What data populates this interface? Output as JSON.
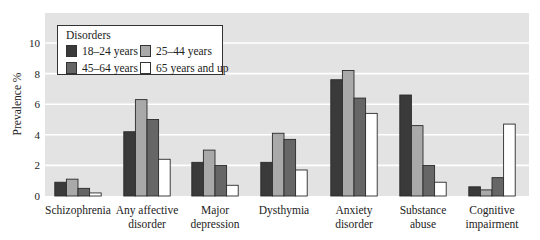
{
  "chart_data": {
    "type": "bar",
    "title": "",
    "xlabel": "",
    "ylabel": "Prevalence %",
    "ylim": [
      0,
      12
    ],
    "yticks": [
      0,
      2,
      4,
      6,
      8,
      10
    ],
    "grid": true,
    "legend_position": "upper left (inside plot)",
    "legend_title": "Disorders",
    "categories": [
      [
        "Schizophrenia"
      ],
      [
        "Any affective",
        "disorder"
      ],
      [
        "Major",
        "depression"
      ],
      [
        "Dysthymia"
      ],
      [
        "Anxiety",
        "disorder"
      ],
      [
        "Substance",
        "abuse"
      ],
      [
        "Cognitive",
        "impairment"
      ]
    ],
    "series": [
      {
        "name": "18–24 years",
        "color": "#3a3a3a",
        "values": [
          0.9,
          4.2,
          2.2,
          2.2,
          7.6,
          6.6,
          0.6
        ]
      },
      {
        "name": "25–44 years",
        "color": "#a9a9a9",
        "values": [
          1.1,
          6.3,
          3.0,
          4.1,
          8.2,
          4.6,
          0.4
        ]
      },
      {
        "name": "45–64 years",
        "color": "#666666",
        "values": [
          0.5,
          5.0,
          2.0,
          3.7,
          6.4,
          2.0,
          1.2
        ]
      },
      {
        "name": "65 years and up",
        "color": "#ffffff",
        "values": [
          0.2,
          2.4,
          0.7,
          1.7,
          5.4,
          0.9,
          4.7
        ]
      }
    ]
  },
  "legend": {
    "title": "Disorders",
    "items": [
      {
        "label": "18–24 years",
        "color": "#3a3a3a"
      },
      {
        "label": "25–44 years",
        "color": "#a9a9a9"
      },
      {
        "label": "45–64 years",
        "color": "#666666"
      },
      {
        "label": "65 years and up",
        "color": "#ffffff"
      }
    ]
  },
  "axis": {
    "ylabel": "Prevalence %"
  }
}
